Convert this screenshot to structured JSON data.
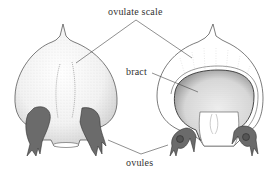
{
  "figure": {
    "labels": {
      "ovulate_scale": "ovulate scale",
      "bract": "bract",
      "ovules": "ovules"
    },
    "colors": {
      "background": "#ffffff",
      "outline": "#333333",
      "stipple": "#8a8a8a",
      "ovule_fill": "#6b6b6b",
      "leader_line": "#444444",
      "text": "#333333"
    }
  }
}
